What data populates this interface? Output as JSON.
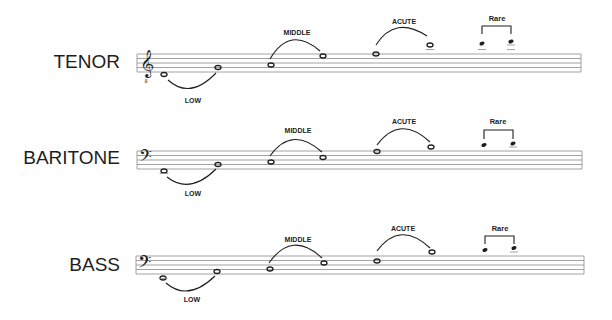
{
  "diagram": {
    "voices": [
      {
        "name": "TENOR",
        "clef": "treble-8vb",
        "ranges": [
          {
            "label": "LOW"
          },
          {
            "label": "MIDDLE"
          },
          {
            "label": "ACUTE"
          },
          {
            "label": "Rare"
          }
        ]
      },
      {
        "name": "BARITONE",
        "clef": "bass",
        "ranges": [
          {
            "label": "LOW"
          },
          {
            "label": "MIDDLE"
          },
          {
            "label": "ACUTE"
          },
          {
            "label": "Rare"
          }
        ]
      },
      {
        "name": "BASS",
        "clef": "bass",
        "ranges": [
          {
            "label": "LOW"
          },
          {
            "label": "MIDDLE"
          },
          {
            "label": "ACUTE"
          },
          {
            "label": "Rare"
          }
        ]
      }
    ],
    "colors": {
      "ink": "#1e1e1e",
      "staff_line": "#8a8a8a",
      "background": "#ffffff"
    }
  }
}
